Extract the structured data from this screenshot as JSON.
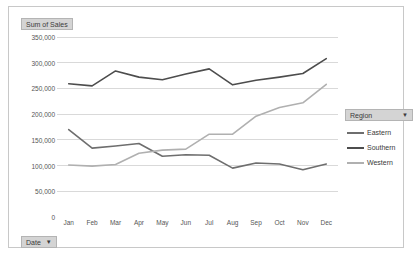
{
  "chart": {
    "value_field_button": "Sum of Sales",
    "date_field_button": "Date",
    "region_field_button": "Region",
    "dropdown_caret": "▼",
    "colors": {
      "eastern": "#6e6e6e",
      "southern": "#4d4d4d",
      "western": "#b0b0b0",
      "gridline": "#d9d9d9",
      "axis_text": "#555555",
      "frame_border": "#c8c8c8",
      "field_button_bg": "#d4d4d4"
    }
  },
  "chart_data": {
    "type": "line",
    "title": "",
    "subtitle": "",
    "xlabel": "",
    "ylabel": "Sum of Sales",
    "ylim": [
      0,
      350000
    ],
    "ytick_labels": [
      "350,000",
      "300,000",
      "250,000",
      "200,000",
      "150,000",
      "100,000",
      "50,000",
      "0"
    ],
    "ytick_values": [
      350000,
      300000,
      250000,
      200000,
      150000,
      100000,
      50000,
      0
    ],
    "grid": true,
    "legend_position": "right",
    "categories": [
      "Jan",
      "Feb",
      "Mar",
      "Apr",
      "May",
      "Jun",
      "Jul",
      "Aug",
      "Sep",
      "Oct",
      "Nov",
      "Dec"
    ],
    "series": [
      {
        "name": "Eastern",
        "color": "#6e6e6e",
        "values": [
          170000,
          134000,
          138000,
          143000,
          118000,
          121000,
          120000,
          95000,
          105000,
          103000,
          92000,
          103000
        ]
      },
      {
        "name": "Southern",
        "color": "#4d4d4d",
        "values": [
          259000,
          255000,
          284000,
          272000,
          267000,
          278000,
          288000,
          257000,
          266000,
          272000,
          279000,
          308000
        ]
      },
      {
        "name": "Western",
        "color": "#b0b0b0",
        "values": [
          101000,
          99000,
          102000,
          124000,
          130000,
          132000,
          161000,
          161000,
          196000,
          213000,
          222000,
          258000
        ]
      }
    ]
  }
}
